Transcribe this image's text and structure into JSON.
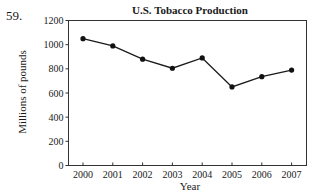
{
  "problem_number": "59.",
  "chart_data": {
    "type": "line",
    "title": "U.S. Tobacco Production",
    "xlabel": "Year",
    "ylabel": "Millions of pounds",
    "categories": [
      "2000",
      "2001",
      "2002",
      "2003",
      "2004",
      "2005",
      "2006",
      "2007"
    ],
    "series": [
      {
        "name": "Tobacco production",
        "values": [
          1050,
          990,
          880,
          805,
          890,
          650,
          735,
          790
        ]
      }
    ],
    "yticks": [
      0,
      200,
      400,
      600,
      800,
      1000,
      1200
    ],
    "ylim": [
      0,
      1200
    ],
    "grid": false,
    "legend": "none",
    "markers": "filled-circle"
  }
}
